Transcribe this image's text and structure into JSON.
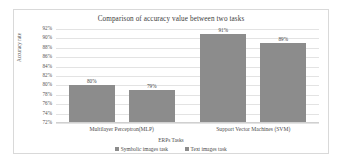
{
  "chart_data": {
    "type": "bar",
    "title": "Comparison of accuracy value between two tasks",
    "xlabel": "ERPs Tasks",
    "ylabel": "Accuracy rate",
    "categories": [
      "Multilayer Perceptron(MLP)",
      "Support Vector Machines (SVM)"
    ],
    "series": [
      {
        "name": "Symbolic images task",
        "values": [
          80,
          91
        ],
        "labels": [
          "80%",
          "91%"
        ],
        "color": "#8c8c8c"
      },
      {
        "name": "Text images task",
        "values": [
          79,
          89
        ],
        "labels": [
          "79%",
          "89%"
        ],
        "color": "#8c8c8c"
      }
    ],
    "ylim": [
      72,
      92
    ],
    "ytick_values": [
      92,
      90,
      88,
      86,
      84,
      82,
      80,
      78,
      76,
      74,
      72
    ],
    "ytick_labels": [
      "92%",
      "90%",
      "88%",
      "86%",
      "84%",
      "82%",
      "80%",
      "78%",
      "76%",
      "74%",
      "72%"
    ],
    "grid": true,
    "legend_position": "bottom",
    "plot_background": "#ffffff",
    "gridline_color": "#e3e3e3",
    "border_color": "#d9d9d9"
  }
}
